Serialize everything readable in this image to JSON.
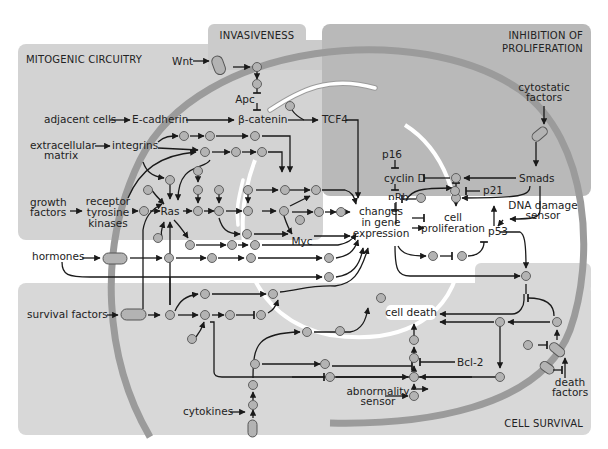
{
  "diagram": {
    "type": "signaling-pathway-map",
    "colors": {
      "background": "#ffffff",
      "mitogenic_panel": "#d3d3d3",
      "invasiveness_panel": "#cbcbcb",
      "inhibition_panel": "#b9b9b9",
      "survival_panel": "#d8d8d8",
      "membrane": "#9b9b9b",
      "nucleus_ring": "#ffffff",
      "node_fill": "#b3b3b3",
      "line": "#1a1a1a"
    },
    "panels": {
      "mitogenic": "MITOGENIC CIRCUITRY",
      "invasiveness": "INVASIVENESS",
      "inhibition_line1": "INHIBITION OF",
      "inhibition_line2": "PROLIFERATION",
      "survival": "CELL SURVIVAL"
    },
    "labels": {
      "wnt": "Wnt",
      "apc": "Apc",
      "adjacent_cells": "adjacent cells",
      "e_cadherin": "E-cadherin",
      "beta_catenin": "β-catenin",
      "tcf4": "TCF4",
      "extracellular_1": "extracellular",
      "extracellular_2": "matrix",
      "integrins": "integrins",
      "growth_1": "growth",
      "growth_2": "factors",
      "rtk_1": "receptor",
      "rtk_2": "tyrosine",
      "rtk_3": "kinases",
      "ras": "Ras",
      "myc": "Myc",
      "hormones": "hormones",
      "survival_factors": "survival factors",
      "cytokines": "cytokines",
      "p16": "p16",
      "cyclin_d": "cyclin D",
      "prb": "pRb",
      "e2f": "E2F",
      "cytostatic_1": "cytostatic",
      "cytostatic_2": "factors",
      "smads": "Smads",
      "p21": "p21",
      "dna_damage_1": "DNA damage",
      "dna_damage_2": "sensor",
      "p53": "p53",
      "changes_1": "changes",
      "changes_2": "in gene",
      "changes_3": "expression",
      "cell_prolif_1": "cell",
      "cell_prolif_2": "proliferation",
      "cell_death": "cell death",
      "bcl2": "Bcl-2",
      "abnormality_1": "abnormality",
      "abnormality_2": "sensor",
      "death_factors_1": "death",
      "death_factors_2": "factors"
    }
  }
}
